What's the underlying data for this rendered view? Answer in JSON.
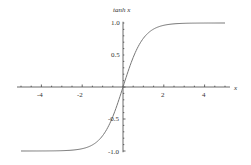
{
  "chart_data": {
    "type": "line",
    "title": "",
    "xlabel": "x",
    "ylabel": "tanh x",
    "xlim": [
      -5,
      5
    ],
    "ylim": [
      -1.0,
      1.0
    ],
    "grid": false,
    "legend": null,
    "x_ticks": [
      -4,
      -2,
      2,
      4
    ],
    "x_tick_labels": [
      "-4",
      "-2",
      "2",
      "4"
    ],
    "y_ticks": [
      1.0,
      0.5,
      -0.5,
      -1.0
    ],
    "y_tick_labels": [
      "1.0",
      "0.5",
      "-0.5",
      "-1.0"
    ],
    "series": [
      {
        "name": "tanh x",
        "function": "tanh",
        "color": "#777777",
        "x": [
          -5,
          -4,
          -3,
          -2,
          -1.5,
          -1,
          -0.5,
          0,
          0.5,
          1,
          1.5,
          2,
          3,
          4,
          5
        ],
        "y": [
          -0.9999,
          -0.9993,
          -0.9951,
          -0.964,
          -0.9051,
          -0.7616,
          -0.4621,
          0,
          0.4621,
          0.7616,
          0.9051,
          0.964,
          0.9951,
          0.9993,
          0.9999
        ]
      }
    ]
  },
  "labels": {
    "xlabel": "x",
    "ylabel": "tanh x",
    "xticks": [
      "-4",
      "-2",
      "2",
      "4"
    ],
    "yticks": [
      "1.0",
      "0.5",
      "-0.5",
      "-1.0"
    ]
  }
}
